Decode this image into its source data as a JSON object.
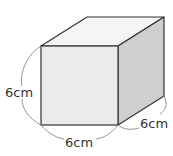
{
  "figure": {
    "type": "cube",
    "labels": {
      "height": "6cm",
      "width": "6cm",
      "depth": "6cm"
    },
    "colors": {
      "front_face": "#ebebeb",
      "top_face": "#f5f5f5",
      "side_face": "#cfcfcf",
      "edge": "#333333",
      "dimension_arc": "#888888"
    }
  }
}
